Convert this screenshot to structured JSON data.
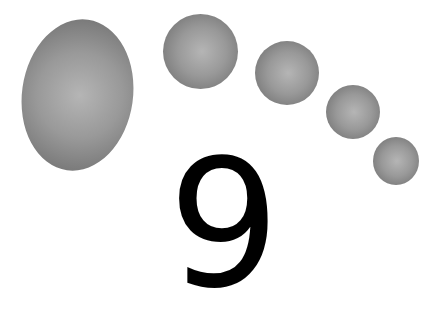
{
  "figure": {
    "digit": "9",
    "shapes": [
      {
        "name": "large-ellipse",
        "left": 22,
        "top": 19,
        "width": 111,
        "height": 152
      },
      {
        "name": "circle-1",
        "left": 163,
        "top": 14,
        "width": 75,
        "height": 75
      },
      {
        "name": "circle-2",
        "left": 255,
        "top": 41,
        "width": 64,
        "height": 64
      },
      {
        "name": "circle-3",
        "left": 326,
        "top": 85,
        "width": 54,
        "height": 54
      },
      {
        "name": "circle-4",
        "left": 373,
        "top": 137,
        "width": 46,
        "height": 48
      }
    ],
    "colors": {
      "background": "#ffffff",
      "shape_fill": "#9a9a9a",
      "digit": "#000000"
    }
  }
}
